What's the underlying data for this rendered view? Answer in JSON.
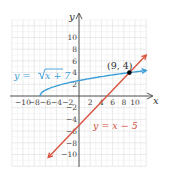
{
  "chart_data": {
    "type": "line",
    "title": "",
    "xlabel": "x",
    "ylabel": "y",
    "xlim": [
      -12,
      12
    ],
    "ylim": [
      -12,
      12
    ],
    "grid": true,
    "x_ticks": [
      -10,
      -8,
      -6,
      -4,
      -2,
      2,
      4,
      6,
      8,
      10
    ],
    "y_ticks": [
      10,
      8,
      6,
      4,
      2,
      -2,
      -4,
      -6,
      -8,
      -10
    ],
    "x_tick_labels": [
      "-10",
      "-8",
      "-6",
      "-4",
      "-2",
      "2",
      "4",
      "6",
      "8",
      "10"
    ],
    "y_tick_labels": [
      "10",
      "8",
      "6",
      "4",
      "2",
      "-2",
      "-4",
      "-6",
      "-8",
      "-10"
    ],
    "series": [
      {
        "name": "y = √(x + 7)",
        "label": "y = √x + 7",
        "color": "#3d9fd8",
        "kind": "sqrt",
        "domain": [
          -7,
          12
        ],
        "x": [
          -7,
          -6,
          -3,
          0,
          2,
          5,
          9,
          12
        ],
        "y": [
          0,
          1,
          2,
          2.65,
          3,
          3.46,
          4,
          4.36
        ]
      },
      {
        "name": "y = x − 5",
        "label": "y = x − 5",
        "color": "#d9533f",
        "kind": "linear",
        "domain": [
          -5.5,
          12
        ],
        "x": [
          -5.5,
          0,
          5,
          9,
          12
        ],
        "y": [
          -10.5,
          -5,
          0,
          4,
          7
        ]
      }
    ],
    "annotations": [
      {
        "text": "(9, 4)",
        "x": 9,
        "y": 4,
        "marker": "point"
      }
    ]
  },
  "labels": {
    "x_axis": "x",
    "y_axis": "y",
    "sqrt_eq_prefix": "y = ",
    "sqrt_eq_radicand": "x + 7",
    "line_eq": "y = x − 5",
    "intersection": "(9, 4)"
  }
}
